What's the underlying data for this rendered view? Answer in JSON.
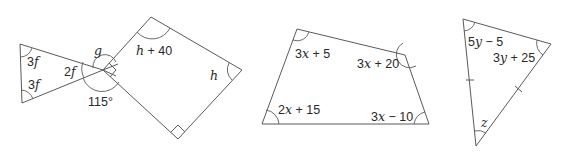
{
  "diagram": {
    "stroke_color": "#5a5a5a",
    "label_color": "#2a2a2a",
    "figures": [
      {
        "id": "triangle-left",
        "type": "triangle",
        "angle_labels": [
          {
            "var": "3",
            "sym": "f",
            "rest": ""
          },
          {
            "var": "3",
            "sym": "f",
            "rest": ""
          },
          {
            "var": "2",
            "sym": "f",
            "rest": ""
          }
        ]
      },
      {
        "id": "center-point",
        "type": "vertex",
        "angle_labels": [
          {
            "var": "",
            "sym": "g",
            "rest": ""
          },
          {
            "var": "115°",
            "sym": "",
            "rest": ""
          }
        ]
      },
      {
        "id": "quadrilateral-left",
        "type": "quadrilateral",
        "angle_labels": [
          {
            "var": "",
            "sym": "h",
            "rest": " + 40"
          },
          {
            "var": "",
            "sym": "h",
            "rest": ""
          }
        ],
        "right_angles": 2
      },
      {
        "id": "quadrilateral-middle",
        "type": "quadrilateral",
        "angle_labels": [
          {
            "var": "3",
            "sym": "x",
            "rest": " + 5"
          },
          {
            "var": "3",
            "sym": "x",
            "rest": " + 20"
          },
          {
            "var": "2",
            "sym": "x",
            "rest": " + 15"
          },
          {
            "var": "3",
            "sym": "x",
            "rest": " − 10"
          }
        ]
      },
      {
        "id": "triangle-right",
        "type": "isosceles-triangle",
        "angle_labels": [
          {
            "var": "5",
            "sym": "y",
            "rest": " − 5"
          },
          {
            "var": "3",
            "sym": "y",
            "rest": " + 25"
          },
          {
            "var": "",
            "sym": "z",
            "rest": ""
          }
        ],
        "equal_side_ticks": 2
      }
    ]
  }
}
